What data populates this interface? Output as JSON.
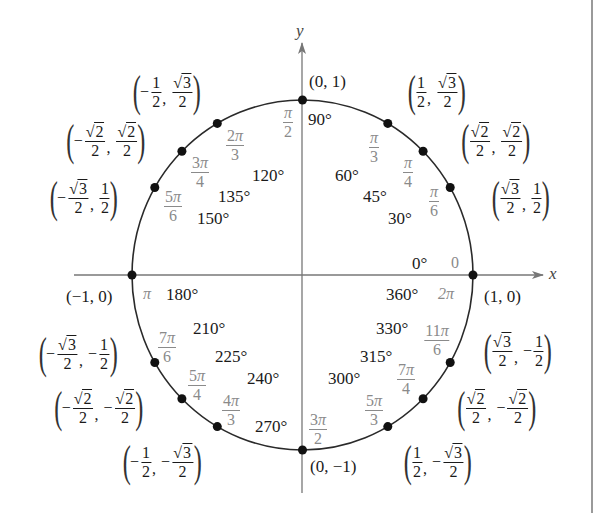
{
  "diagram": {
    "axes": {
      "x_label": "x",
      "y_label": "y"
    },
    "colors": {
      "circle": "#2a2a2a",
      "axes": "#777777",
      "radian_text": "#8a8a8a",
      "degree_text": "#1a1a1a",
      "border": "#9a9a9a"
    },
    "axis_points": {
      "top": "(0, 1)",
      "bottom": "(0, −1)",
      "left": "(−1, 0)",
      "right": "(1, 0)"
    },
    "degrees": {
      "d0": "0°",
      "d30": "30°",
      "d45": "45°",
      "d60": "60°",
      "d90": "90°",
      "d120": "120°",
      "d135": "135°",
      "d150": "150°",
      "d180": "180°",
      "d210": "210°",
      "d225": "225°",
      "d240": "240°",
      "d270": "270°",
      "d300": "300°",
      "d315": "315°",
      "d330": "330°",
      "d360": "360°"
    },
    "radians": {
      "r0": "0",
      "r2pi": "2π",
      "rpi": "π",
      "r30": {
        "num": "π",
        "den": "6"
      },
      "r45": {
        "num": "π",
        "den": "4"
      },
      "r60": {
        "num": "π",
        "den": "3"
      },
      "r90": {
        "num": "π",
        "den": "2"
      },
      "r120": {
        "num_coef": "2",
        "num": "π",
        "den": "3"
      },
      "r135": {
        "num_coef": "3",
        "num": "π",
        "den": "4"
      },
      "r150": {
        "num_coef": "5",
        "num": "π",
        "den": "6"
      },
      "r210": {
        "num_coef": "7",
        "num": "π",
        "den": "6"
      },
      "r225": {
        "num_coef": "5",
        "num": "π",
        "den": "4"
      },
      "r240": {
        "num_coef": "4",
        "num": "π",
        "den": "3"
      },
      "r270": {
        "num_coef": "3",
        "num": "π",
        "den": "2"
      },
      "r300": {
        "num_coef": "5",
        "num": "π",
        "den": "3"
      },
      "r315": {
        "num_coef": "7",
        "num": "π",
        "den": "4"
      },
      "r330": {
        "num_coef": "11",
        "num": "π",
        "den": "6"
      }
    },
    "coordinates": {
      "c30": {
        "x_sign": "",
        "x_num": "3",
        "x_sqrt": true,
        "x_den": "2",
        "y_sign": "",
        "y_num": "1",
        "y_sqrt": false,
        "y_den": "2",
        "text": "(√3/2, 1/2)"
      },
      "c45": {
        "x_sign": "",
        "x_num": "2",
        "x_sqrt": true,
        "x_den": "2",
        "y_sign": "",
        "y_num": "2",
        "y_sqrt": true,
        "y_den": "2",
        "text": "(√2/2, √2/2)"
      },
      "c60": {
        "x_sign": "",
        "x_num": "1",
        "x_sqrt": false,
        "x_den": "2",
        "y_sign": "",
        "y_num": "3",
        "y_sqrt": true,
        "y_den": "2",
        "text": "(1/2, √3/2)"
      },
      "c120": {
        "x_sign": "−",
        "x_num": "1",
        "x_sqrt": false,
        "x_den": "2",
        "y_sign": "",
        "y_num": "3",
        "y_sqrt": true,
        "y_den": "2",
        "text": "(−1/2, √3/2)"
      },
      "c135": {
        "x_sign": "−",
        "x_num": "2",
        "x_sqrt": true,
        "x_den": "2",
        "y_sign": "",
        "y_num": "2",
        "y_sqrt": true,
        "y_den": "2",
        "text": "(−√2/2, √2/2)"
      },
      "c150": {
        "x_sign": "−",
        "x_num": "3",
        "x_sqrt": true,
        "x_den": "2",
        "y_sign": "",
        "y_num": "1",
        "y_sqrt": false,
        "y_den": "2",
        "text": "(−√3/2, 1/2)"
      },
      "c210": {
        "x_sign": "−",
        "x_num": "3",
        "x_sqrt": true,
        "x_den": "2",
        "y_sign": "−",
        "y_num": "1",
        "y_sqrt": false,
        "y_den": "2",
        "text": "(−√3/2, −1/2)"
      },
      "c225": {
        "x_sign": "−",
        "x_num": "2",
        "x_sqrt": true,
        "x_den": "2",
        "y_sign": "−",
        "y_num": "2",
        "y_sqrt": true,
        "y_den": "2",
        "text": "(−√2/2, −√2/2)"
      },
      "c240": {
        "x_sign": "−",
        "x_num": "1",
        "x_sqrt": false,
        "x_den": "2",
        "y_sign": "−",
        "y_num": "3",
        "y_sqrt": true,
        "y_den": "2",
        "text": "(−1/2, −√3/2)"
      },
      "c300": {
        "x_sign": "",
        "x_num": "1",
        "x_sqrt": false,
        "x_den": "2",
        "y_sign": "−",
        "y_num": "3",
        "y_sqrt": true,
        "y_den": "2",
        "text": "(1/2, −√3/2)"
      },
      "c315": {
        "x_sign": "",
        "x_num": "2",
        "x_sqrt": true,
        "x_den": "2",
        "y_sign": "−",
        "y_num": "2",
        "y_sqrt": true,
        "y_den": "2",
        "text": "(√2/2, −√2/2)"
      },
      "c330": {
        "x_sign": "",
        "x_num": "3",
        "x_sqrt": true,
        "x_den": "2",
        "y_sign": "−",
        "y_num": "1",
        "y_sqrt": false,
        "y_den": "2",
        "text": "(√3/2, −1/2)"
      }
    },
    "sqrt_symbol": "√",
    "comma": ",",
    "lparen": "(",
    "rparen": ")"
  }
}
